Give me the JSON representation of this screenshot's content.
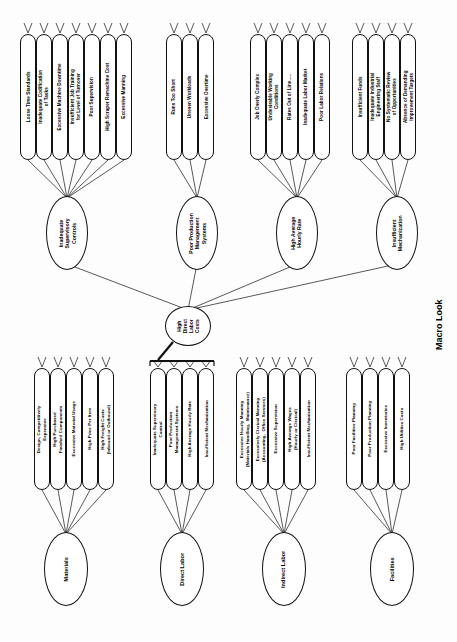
{
  "caption": {
    "text": "Macro Look"
  },
  "core": {
    "label": "High\nDirect\nLabor\nCosts"
  },
  "macro": {
    "groups": [
      {
        "name": "inadequate-supervisory-controls",
        "mid_label": "Inadequate\nSupervisory\nControls",
        "leaves": [
          "Loose Time Standards",
          "Inadequate Codification\nof Tasks",
          "Excessive Machine Downtime",
          "Insufficient Job Training\nfor Level of Turnover",
          "Poor Supervision",
          "High Scraper Remachine Cost",
          "Excessive Manning"
        ]
      },
      {
        "name": "poor-production-management-systems",
        "mid_label": "Poor Production\nManagement\nSystems",
        "leaves": [
          "Runs Too Short",
          "Uneven Workloads",
          "Excessive Overtime"
        ]
      },
      {
        "name": "high-average-hourly-rate",
        "mid_label": "High Average\nHourly Rate",
        "leaves": [
          "Job Overly Complex",
          "Undesirable Working\nConditions",
          "Rates Out of Line.....",
          "Inadequate Labor Market",
          "Poor Labor Relations"
        ]
      },
      {
        "name": "insufficient-mechanization",
        "mid_label": "Insufficient\nMechanization",
        "leaves": [
          "Insufficient Funds",
          "Inadequate Industrial\nEngineering Staff",
          "No Systematic Review\nof Opportunities",
          "Absence of Demanding\nImprovement Targets"
        ]
      }
    ]
  },
  "micro": {
    "groups": [
      {
        "name": "materials",
        "cat_label": "Materials",
        "leaves": [
          "Design, Competitively\nExpensive",
          "High Purchased\nFinished Components",
          "Excessive Material Usage",
          "High Price Per Item",
          "High Freight Costs\n(Inbound or Outbound)"
        ]
      },
      {
        "name": "direct-labor",
        "cat_label": "Direct Labor",
        "leaves": [
          "Inadequate Supervisory\nControl",
          "Poor Production\nManagement Systems",
          "High Average Hourly Rate",
          "Insufficient Mechanization"
        ]
      },
      {
        "name": "indirect-labor",
        "cat_label": "Indirect Labor",
        "leaves": [
          "Excessive Hourly Manning\n(Materials Handling,  Maintenance)",
          "Excessively Clerical Manning\n(Accounting,  Office Services)",
          "Excessive Supervision",
          "High Average Wages\n(Hourly or Clerical)",
          "Insufficient Mechanization"
        ]
      },
      {
        "name": "facilities",
        "cat_label": "Facilities",
        "leaves": [
          "Poor Facilities Planning",
          "Poor Production Planning",
          "Excessive Inventories",
          "High Utilities Costs"
        ]
      }
    ]
  },
  "colors": {
    "ink": "#111111",
    "paper": "#fdfdfd"
  }
}
